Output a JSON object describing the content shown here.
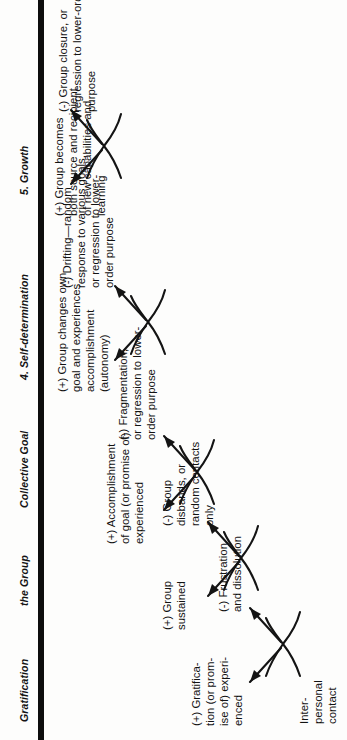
{
  "figure": {
    "orientation": "landscape content rotated 90 degrees counter-clockwise",
    "ink_color": "#141414",
    "paper_color": "#fdfdfc"
  },
  "columns": [
    {
      "id": "col-gratification",
      "label": "Gratification"
    },
    {
      "id": "col-the-group",
      "label": "the Group"
    },
    {
      "id": "col-collective-goal",
      "label": "Collective Goal"
    },
    {
      "id": "col-self-determination",
      "label": "4. Self-determination"
    },
    {
      "id": "col-growth",
      "label": "5. Growth"
    }
  ],
  "nodes": {
    "start": {
      "id": "interpersonal-contact",
      "text": "Inter-\npersonal\ncontact"
    },
    "stage1_positive": {
      "id": "gratification-positive",
      "text": "(+) Gratifica-\ntion (or prom-\nise of) experi-\nenced"
    },
    "stage1_negative": {
      "id": "frustration-negative",
      "text": "(-) Frustration\nand dissolution"
    },
    "stage2_positive": {
      "id": "group-sustained-positive",
      "text": "(+) Group\nsustained"
    },
    "stage2_negative": {
      "id": "group-disbands-negative",
      "text": "(-) Group\ndisbands, or\nrandom contacts\nonly"
    },
    "stage3_positive": {
      "id": "accomplishment-positive",
      "text": "(+) Accomplishment\nof goal (or promise of)\nexperienced"
    },
    "stage3_negative": {
      "id": "fragmentation-negative",
      "text": "(-) Fragmentation,\nor regression to lower-\norder purpose"
    },
    "stage4_positive": {
      "id": "autonomy-positive",
      "text": "(+) Group changes own\ngoal and experiences\naccomplishment\n(autonomy)"
    },
    "stage4_negative": {
      "id": "drifting-negative",
      "text": "(-) Drifting—random\nresponse to various goals,\nor regression to lower-\norder purpose"
    },
    "stage5_positive": {
      "id": "growth-positive",
      "text": "(+) Group becomes\nboth source and recipient\nof new capabilities and\nlearning"
    },
    "stage5_negative": {
      "id": "group-closure-negative",
      "text": "(-) Group closure, or\nregression to lower-order\npurpose"
    }
  }
}
